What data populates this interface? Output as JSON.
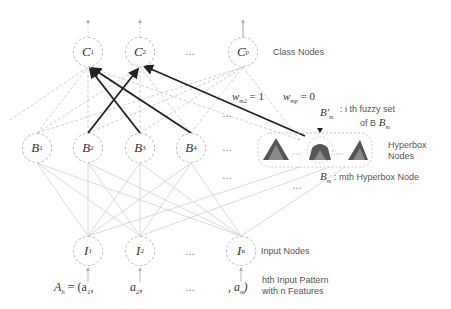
{
  "labels": {
    "class_nodes": "Class Nodes",
    "hyperbox_nodes_line1": "Hyperbox",
    "hyperbox_nodes_line2": "Nodes",
    "input_nodes": "Input Nodes",
    "fuzzy_set_line1": ": i th fuzzy set",
    "fuzzy_set_line2": "of B",
    "hyperbox_node": ": mth Hyperbox Node",
    "input_pattern_line1": "hth Input Pattern",
    "input_pattern_line2": "with n Features"
  },
  "class_layer": {
    "nodes": [
      {
        "name": "C",
        "sub": "1"
      },
      {
        "name": "C",
        "sub": "2"
      },
      {
        "name": "C",
        "sub": "p"
      }
    ],
    "ellipsis": "…"
  },
  "hyperbox_layer": {
    "nodes": [
      {
        "name": "B",
        "sub": "1"
      },
      {
        "name": "B",
        "sub": "2"
      },
      {
        "name": "B",
        "sub": "3"
      },
      {
        "name": "B",
        "sub": "4"
      }
    ],
    "ellipsis": "…",
    "bm_label": "B",
    "bm_sub": "m",
    "bm_prime_label": "B'",
    "bm_prime_sub": "m"
  },
  "input_layer": {
    "nodes": [
      {
        "name": "I",
        "sub": "1"
      },
      {
        "name": "I",
        "sub": "2"
      },
      {
        "name": "I",
        "sub": "n"
      }
    ],
    "ellipsis": "…"
  },
  "weights": {
    "w_m2": "w",
    "w_m2_sub": "m2",
    "w_m2_val": "= 1",
    "w_mp": "w",
    "w_mp_sub": "mp",
    "w_mp_val": "= 0"
  },
  "input_pattern": {
    "prefix": "A",
    "prefix_sub": "h",
    "eq": " = (a",
    "a1_sub": "1",
    "a1_tail": ",",
    "a2": "a",
    "a2_sub": "2",
    "a2_tail": ",",
    "ellipsis": "…",
    "an_head": ", a",
    "an_sub": "n",
    "an_tail": ")"
  },
  "colors": {
    "strong_edge": "#222222",
    "weak_edge": "#bbbbbb",
    "node_border": "#bbbbbb",
    "label_text": "#555555"
  }
}
